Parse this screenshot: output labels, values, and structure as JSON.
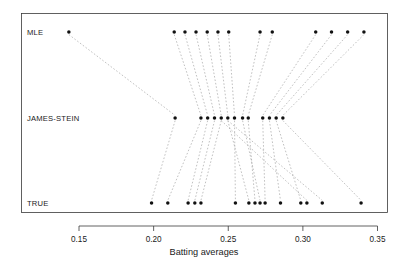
{
  "chart_data": {
    "type": "scatter",
    "title": "",
    "xlabel": "Batting averages",
    "ylabel": "",
    "xlim": [
      0.131,
      0.359
    ],
    "ylim": [
      0,
      3
    ],
    "grid": false,
    "legend": false,
    "xticks": [
      0.15,
      0.2,
      0.25,
      0.3,
      0.35
    ],
    "xtick_labels": [
      "0.15",
      "0.20",
      "0.25",
      "0.30",
      "0.35"
    ],
    "ytick_labels": [
      "MLE",
      "JAMES-STEIN",
      "TRUE"
    ],
    "rows": [
      {
        "name": "MLE",
        "y": 2
      },
      {
        "name": "JAMES-STEIN",
        "y": 1
      },
      {
        "name": "TRUE",
        "y": 0
      }
    ],
    "series": [
      {
        "name": "MLE",
        "row": "MLE",
        "values": [
          0.1432,
          0.2138,
          0.221,
          0.2284,
          0.2359,
          0.2431,
          0.2503,
          0.2713,
          0.2795,
          0.3086,
          0.3192,
          0.33,
          0.3409
        ]
      },
      {
        "name": "JAMES-STEIN",
        "row": "JAMES-STEIN",
        "values": [
          0.2144,
          0.2317,
          0.2362,
          0.2408,
          0.2453,
          0.2497,
          0.2542,
          0.2596,
          0.2634,
          0.2731,
          0.2776,
          0.2821,
          0.2866
        ]
      },
      {
        "name": "TRUE",
        "row": "TRUE",
        "values": [
          0.1986,
          0.2095,
          0.2231,
          0.2276,
          0.2317,
          0.2548,
          0.2638,
          0.2679,
          0.2713,
          0.2747,
          0.285,
          0.2986,
          0.3027,
          0.313,
          0.339
        ]
      }
    ],
    "links_mle_to_js": [
      [
        0.1432,
        0.2144
      ],
      [
        0.2138,
        0.2317
      ],
      [
        0.221,
        0.2362
      ],
      [
        0.2284,
        0.2408
      ],
      [
        0.2359,
        0.2453
      ],
      [
        0.2431,
        0.2497
      ],
      [
        0.2503,
        0.2542
      ],
      [
        0.2713,
        0.2596
      ],
      [
        0.2795,
        0.2634
      ],
      [
        0.3086,
        0.2731
      ],
      [
        0.3192,
        0.2776
      ],
      [
        0.33,
        0.2821
      ],
      [
        0.3409,
        0.2866
      ]
    ],
    "links_js_to_true": [
      [
        0.2144,
        0.1986
      ],
      [
        0.2317,
        0.2095
      ],
      [
        0.2362,
        0.2231
      ],
      [
        0.2408,
        0.2276
      ],
      [
        0.2453,
        0.2317
      ],
      [
        0.2497,
        0.2638
      ],
      [
        0.2542,
        0.2548
      ],
      [
        0.2596,
        0.2713
      ],
      [
        0.2634,
        0.2679
      ],
      [
        0.2731,
        0.2747
      ],
      [
        0.2776,
        0.285
      ],
      [
        0.2821,
        0.2986
      ],
      [
        0.2866,
        0.339
      ],
      [
        0.2453,
        0.3027
      ],
      [
        0.2497,
        0.313
      ]
    ],
    "colors": {
      "point": "#111111",
      "link": "#9a9a9a",
      "frame": "#3a3a3a",
      "text": "#1a1a1a",
      "background": "#ffffff"
    }
  }
}
